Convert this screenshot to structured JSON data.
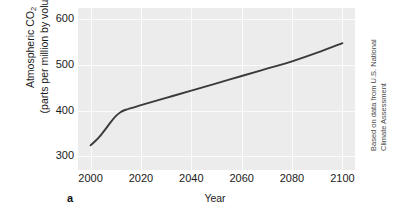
{
  "figure": {
    "panel_letter": "a",
    "credit_line_1": "Based on data from U.S. National",
    "credit_line_2": "Climate Assessment"
  },
  "axes": {
    "y_title_line_1_prefix": "Atmospheric CO",
    "y_title_line_1_subscript": "2",
    "y_title_line_2": "(parts per million by volume)",
    "x_title": "Year"
  },
  "colors": {
    "panel_background": "#ececec",
    "gridline": "#fbfbfb",
    "line": "#3a3a3a",
    "text": "#1a1a1a",
    "credit_text": "#4a4a4a",
    "figure_background": "#ffffff"
  },
  "chart_data": {
    "type": "line",
    "title": "",
    "xlabel": "Year",
    "ylabel": "Atmospheric CO2 (parts per million by volume)",
    "xlim": [
      1995,
      2105
    ],
    "ylim": [
      270,
      625
    ],
    "xticks": [
      2000,
      2020,
      2040,
      2060,
      2080,
      2100
    ],
    "xticklabels": [
      "2000",
      "2020",
      "2040",
      "2060",
      "2080",
      "2100"
    ],
    "yticks": [
      300,
      400,
      500,
      600
    ],
    "yticklabels": [
      "300",
      "400",
      "500",
      "600"
    ],
    "grid": true,
    "legend": false,
    "series": [
      {
        "name": "Atmospheric CO2",
        "x": [
          2000,
          2002,
          2004,
          2006,
          2008,
          2010,
          2012,
          2014,
          2020,
          2030,
          2040,
          2050,
          2060,
          2070,
          2080,
          2090,
          2100
        ],
        "values": [
          324,
          334,
          346,
          360,
          375,
          388,
          397,
          402,
          412,
          428,
          444,
          460,
          476,
          492,
          508,
          527,
          548
        ]
      }
    ]
  },
  "ticks": {
    "y": [
      {
        "label": "600",
        "top": 22
      },
      {
        "label": "500",
        "top": 66
      },
      {
        "label": "400",
        "top": 111
      },
      {
        "label": "300",
        "top": 152
      }
    ],
    "x": [
      {
        "label": "2000",
        "left": 100
      },
      {
        "label": "2020",
        "left": 148
      },
      {
        "label": "2040",
        "left": 196
      },
      {
        "label": "2060",
        "left": 244
      },
      {
        "label": "2080",
        "left": 292
      },
      {
        "label": "2100",
        "left": 339
      }
    ]
  }
}
